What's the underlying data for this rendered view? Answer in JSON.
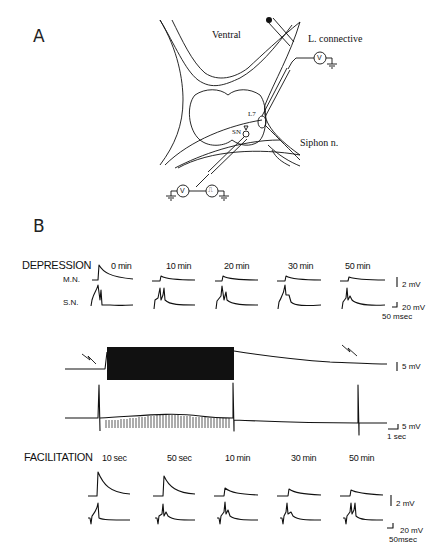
{
  "figure": {
    "panel_a": {
      "label": "A",
      "diagram": {
        "labels": {
          "ventral": "Ventral",
          "connective": "L. connective",
          "siphon": "Siphon n.",
          "l7": "L7",
          "sn": "SN"
        },
        "instruments": [
          {
            "symbol": "V",
            "role": "voltmeter-L7"
          },
          {
            "symbol": "V",
            "role": "voltmeter-SN"
          },
          {
            "symbol": "⎍",
            "role": "stimulator-SN"
          }
        ]
      }
    },
    "panel_b": {
      "label": "B",
      "depression": {
        "title": "DEPRESSION",
        "rows": [
          "M.N.",
          "S.N."
        ],
        "times": [
          "0 min",
          "10 min",
          "20 min",
          "30 min",
          "50 min"
        ],
        "mn_amplitudes_px": [
          12,
          5,
          5,
          4,
          3
        ],
        "scale_bars": {
          "mn": "2 mV",
          "sn": "20 mV",
          "time": "50 msec"
        }
      },
      "continuous": {
        "scale_bars": {
          "top": "5 mV",
          "bottom": "5 mV",
          "time": "1 sec"
        }
      },
      "facilitation": {
        "title": "FACILITATION",
        "times": [
          "10 sec",
          "50 sec",
          "10 min",
          "30 min",
          "50 min"
        ],
        "mn_amplitudes_px": [
          18,
          14,
          5,
          4,
          3
        ],
        "scale_bars": {
          "mn": "2 mV",
          "sn": "20 mV",
          "time": "50msec"
        }
      }
    }
  }
}
